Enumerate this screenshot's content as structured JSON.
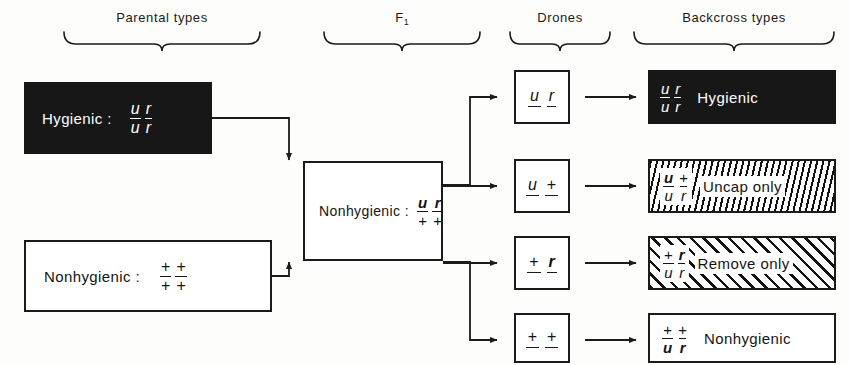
{
  "headers": [
    {
      "id": "parental",
      "label": "Parental types"
    },
    {
      "id": "f1",
      "label": "F",
      "sub": "1"
    },
    {
      "id": "drones",
      "label": "Drones"
    },
    {
      "id": "backcross",
      "label": "Backcross types"
    }
  ],
  "parents": [
    {
      "id": "hygienic",
      "label": "Hygienic :",
      "style": "solid",
      "genotype": [
        {
          "num": "u",
          "den": "u"
        },
        {
          "num": "r",
          "den": "r"
        }
      ]
    },
    {
      "id": "nonhygienic",
      "label": "Nonhygienic :",
      "style": "outline",
      "genotype": [
        {
          "num": "+",
          "den": "+"
        },
        {
          "num": "+",
          "den": "+"
        }
      ]
    }
  ],
  "f1": {
    "id": "f1-nonhygienic",
    "label": "Nonhygienic :",
    "style": "outline",
    "genotype": [
      {
        "num": "u",
        "den": "+"
      },
      {
        "num": "r",
        "den": "+"
      }
    ]
  },
  "drones": [
    {
      "id": "drone-ur",
      "alleles": [
        "u",
        "r"
      ]
    },
    {
      "id": "drone-uplus",
      "alleles": [
        "u",
        "+"
      ]
    },
    {
      "id": "drone-plusr",
      "alleles": [
        "+",
        "r"
      ]
    },
    {
      "id": "drone-plusplus",
      "alleles": [
        "+",
        "+"
      ]
    }
  ],
  "backcross": [
    {
      "id": "bc-hygienic",
      "label": "Hygienic",
      "fill": "solid",
      "genotype": [
        {
          "num": "u",
          "den": "u"
        },
        {
          "num": "r",
          "den": "r"
        }
      ]
    },
    {
      "id": "bc-uncap",
      "label": "Uncap only",
      "fill": "hatch-steep",
      "genotype": [
        {
          "num": "u",
          "den": "u"
        },
        {
          "num": "+",
          "den": "r"
        }
      ]
    },
    {
      "id": "bc-remove",
      "label": "Remove only",
      "fill": "hatch-diag",
      "genotype": [
        {
          "num": "+",
          "den": "u"
        },
        {
          "num": "r",
          "den": "r"
        }
      ]
    },
    {
      "id": "bc-nonhygienic",
      "label": "Nonhygienic",
      "fill": "plain",
      "genotype": [
        {
          "num": "+",
          "den": "u"
        },
        {
          "num": "+",
          "den": "r"
        }
      ]
    }
  ],
  "colors": {
    "ink": "#1b1b1b",
    "solid_fill": "#171717",
    "paper": "#fdfdfb"
  }
}
